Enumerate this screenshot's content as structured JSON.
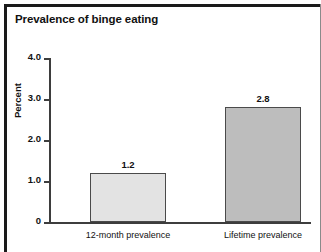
{
  "figure": {
    "title": "Prevalence of binge eating"
  },
  "chart_data": {
    "type": "bar",
    "title": "Prevalence of binge eating",
    "xlabel": "",
    "ylabel": "Percent",
    "categories": [
      "12-month prevalence",
      "Lifetime prevalence"
    ],
    "values": [
      1.2,
      2.8
    ],
    "value_labels": [
      "1.2",
      "2.8"
    ],
    "ylim": [
      0,
      4.0
    ],
    "yticks": [
      0,
      1.0,
      2.0,
      3.0,
      4.0
    ],
    "ytick_labels": [
      "0",
      "1.0",
      "2.0",
      "3.0",
      "4.0"
    ],
    "grid": false,
    "legend": "none",
    "bar_colors": [
      "#e3e3e3",
      "#bdbdbd"
    ],
    "bar_edge_color": "#4a4a4a"
  }
}
